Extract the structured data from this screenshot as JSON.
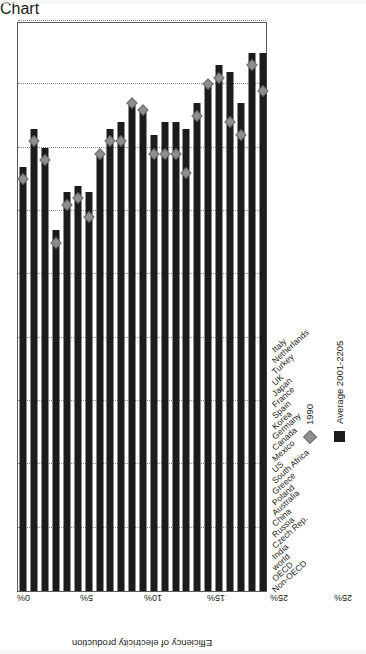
{
  "chart_data": {
    "type": "bar",
    "orientation": "horizontal",
    "title": "",
    "xlabel": "",
    "ylabel": "Efficiency of electricity production",
    "value_axis_title": "Efficiency of electricity production",
    "value_axis_ticks": [
      "45%",
      "40%",
      "35%",
      "30%",
      "25%",
      "25%",
      "15%",
      "10%",
      "5%",
      "0%"
    ],
    "value_axis_tick_values": [
      45,
      40,
      35,
      30,
      25,
      20,
      15,
      10,
      5,
      0
    ],
    "xlim": [
      0,
      45
    ],
    "grid": true,
    "grid_axis": "value",
    "legend_position": "right",
    "categories": [
      "Non-OECD",
      "OECD",
      "world",
      "India",
      "Czech Rep.",
      "Russia",
      "China",
      "Australia",
      "Poland",
      "Greece",
      "South Africa",
      "US",
      "Mexico",
      "Canada",
      "Germany",
      "Korea",
      "Spain",
      "France",
      "Japan",
      "UK",
      "Turkey",
      "Netherlands",
      "Italy"
    ],
    "series": [
      {
        "name": "Average 2001-2205",
        "type": "bar",
        "color": "#1c1c1c",
        "values": [
          33.5,
          36.5,
          35.0,
          28.5,
          31.5,
          32.0,
          31.5,
          34.5,
          36.5,
          37.0,
          38.5,
          38.0,
          36.0,
          37.0,
          37.0,
          36.5,
          38.5,
          40.0,
          41.5,
          41.0,
          38.5,
          42.5,
          42.5
        ]
      },
      {
        "name": "1990",
        "type": "scatter",
        "marker": "diamond",
        "color": "#8e8e8e",
        "values": [
          32.5,
          35.5,
          34.0,
          27.5,
          30.5,
          31.0,
          29.5,
          34.5,
          35.5,
          35.5,
          38.5,
          38.0,
          34.5,
          34.5,
          34.5,
          33.0,
          37.5,
          40.0,
          40.5,
          37.0,
          36.0,
          41.5,
          39.5
        ]
      }
    ],
    "legend": [
      {
        "label": "1990",
        "marker": "diamond",
        "color": "#8e8e8e"
      },
      {
        "label": "Average 2001-2205",
        "marker": "square",
        "color": "#1c1c1c"
      }
    ]
  },
  "colors": {
    "bar": "#1c1c1c",
    "marker": "#8e8e8e",
    "grid": "#8c8c8c",
    "frame": "#5a5a5a",
    "text": "#222222",
    "background": "#ffffff"
  }
}
